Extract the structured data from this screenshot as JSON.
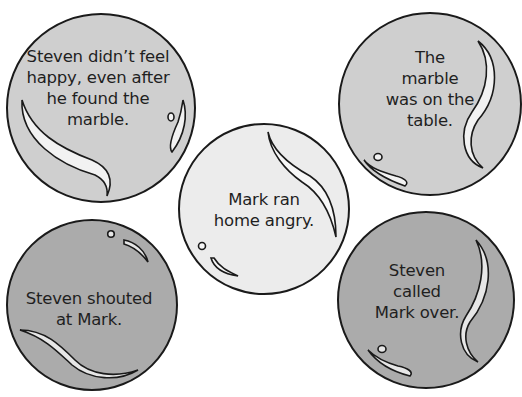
{
  "colors": {
    "background": "#ffffff",
    "outline": "#1a1a1a",
    "highlight": "#f2f2f2",
    "light_marble": "#ececec",
    "medium_marble": "#cfcfcf",
    "dark_marble": "#ababab"
  },
  "marbles": [
    {
      "id": "top-left",
      "text": "Steven didn’t feel\nhappy, even after\nhe found the\nmarble.",
      "shade": "medium"
    },
    {
      "id": "top-right",
      "text": "The marble\nwas on the\ntable.",
      "shade": "medium"
    },
    {
      "id": "middle",
      "text": "Mark ran\nhome angry.",
      "shade": "light"
    },
    {
      "id": "bottom-left",
      "text": "Steven shouted\nat Mark.",
      "shade": "dark"
    },
    {
      "id": "bottom-right",
      "text": "Steven called\nMark over.",
      "shade": "dark"
    }
  ]
}
